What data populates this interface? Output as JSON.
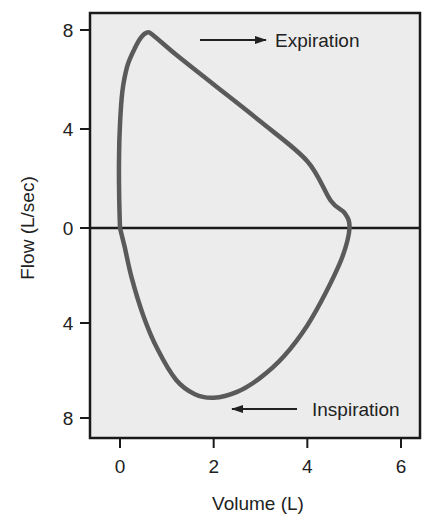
{
  "chart_data": {
    "type": "line",
    "title": "",
    "xlabel": "Volume (L)",
    "ylabel": "Flow (L/sec)",
    "xlim": [
      -0.65,
      6.4
    ],
    "ylim": [
      -8.8,
      8.4
    ],
    "x_ticks": [
      0,
      2,
      4,
      6
    ],
    "x_tick_labels": [
      "0",
      "2",
      "4",
      "6"
    ],
    "y_ticks": [
      8,
      4,
      0,
      -4,
      -8
    ],
    "y_tick_labels": [
      "8",
      "4",
      "0",
      "4",
      "8"
    ],
    "grid": false,
    "zero_line": true,
    "background": "#ececec",
    "series": [
      {
        "name": "Flow-volume loop",
        "color": "#5a5a5a",
        "closed": true,
        "points": [
          [
            0.0,
            0.0
          ],
          [
            -0.02,
            1.5
          ],
          [
            -0.02,
            3.0
          ],
          [
            0.0,
            4.2
          ],
          [
            0.05,
            5.5
          ],
          [
            0.15,
            6.5
          ],
          [
            0.3,
            7.2
          ],
          [
            0.45,
            7.7
          ],
          [
            0.58,
            7.9
          ],
          [
            0.7,
            7.8
          ],
          [
            1.2,
            7.0
          ],
          [
            2.0,
            5.8
          ],
          [
            3.0,
            4.3
          ],
          [
            4.0,
            2.7
          ],
          [
            4.5,
            1.1
          ],
          [
            4.8,
            0.6
          ],
          [
            4.9,
            0.0
          ],
          [
            4.75,
            -1.2
          ],
          [
            4.4,
            -2.7
          ],
          [
            4.0,
            -4.1
          ],
          [
            3.5,
            -5.4
          ],
          [
            3.0,
            -6.3
          ],
          [
            2.5,
            -6.9
          ],
          [
            2.0,
            -7.15
          ],
          [
            1.6,
            -7.0
          ],
          [
            1.2,
            -6.4
          ],
          [
            0.8,
            -5.1
          ],
          [
            0.5,
            -3.7
          ],
          [
            0.25,
            -2.1
          ],
          [
            0.1,
            -0.8
          ],
          [
            0.0,
            0.0
          ]
        ]
      }
    ],
    "annotations": [
      {
        "text": "Expiration",
        "arrow": "right",
        "x": 3.3,
        "y": 7.6
      },
      {
        "text": "Inspiration",
        "arrow": "left",
        "x": 3.8,
        "y": -7.6
      }
    ]
  }
}
